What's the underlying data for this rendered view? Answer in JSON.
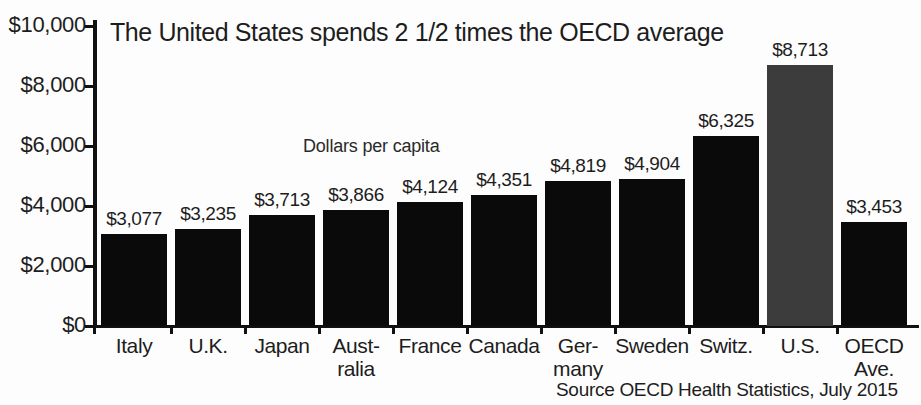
{
  "chart_data": {
    "type": "bar",
    "title": "The United States spends 2 1/2 times the OECD average",
    "annotation": "Dollars per capita",
    "source": "Source OECD Health Statistics, July 2015",
    "xlabel": "",
    "ylabel": "",
    "ylim": [
      0,
      10000
    ],
    "grid": false,
    "legend": "none",
    "ytick_labels": [
      "$10,000",
      "$8,000",
      "$6,000",
      "$4,000",
      "$2,000",
      "$0"
    ],
    "ytick_values": [
      10000,
      8000,
      6000,
      4000,
      2000,
      0
    ],
    "categories": [
      "Italy",
      "U.K.",
      "Japan",
      "Aust-\nralia",
      "France",
      "Canada",
      "Ger-\nmany",
      "Sweden",
      "Switz.",
      "U.S.",
      "OECD\nAve."
    ],
    "values": [
      3077,
      3235,
      3713,
      3866,
      4124,
      4351,
      4819,
      4904,
      6325,
      8713,
      3453
    ],
    "value_labels": [
      "$3,077",
      "$3,235",
      "$3,713",
      "$3,866",
      "$4,124",
      "$4,351",
      "$4,819",
      "$4,904",
      "$6,325",
      "$8,713",
      "$3,453"
    ],
    "highlight_index": 9,
    "colors": {
      "bar": "#0a0a0a",
      "bar_highlight": "#3c3c3c",
      "axis": "#111111",
      "text": "#1d1d1d",
      "background": "#fdfdfd"
    }
  }
}
